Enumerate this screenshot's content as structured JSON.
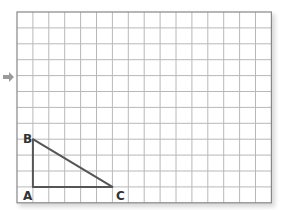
{
  "diagram": {
    "type": "grid-triangle",
    "grid": {
      "columns": 16,
      "rows": 12,
      "origin_px": [
        17,
        12
      ],
      "cell_px": 15.9,
      "line_color": "#b8b8b8",
      "border_color": "#888888"
    },
    "triangle": {
      "stroke_color": "#555555",
      "vertices": [
        {
          "name": "A",
          "col": 1,
          "row": 11
        },
        {
          "name": "B",
          "col": 1,
          "row": 8
        },
        {
          "name": "C",
          "col": 6,
          "row": 11
        }
      ]
    },
    "labels": {
      "A": "A",
      "B": "B",
      "C": "C"
    },
    "arrow": {
      "icon": "arrow-right-icon",
      "color": "#999999"
    }
  }
}
